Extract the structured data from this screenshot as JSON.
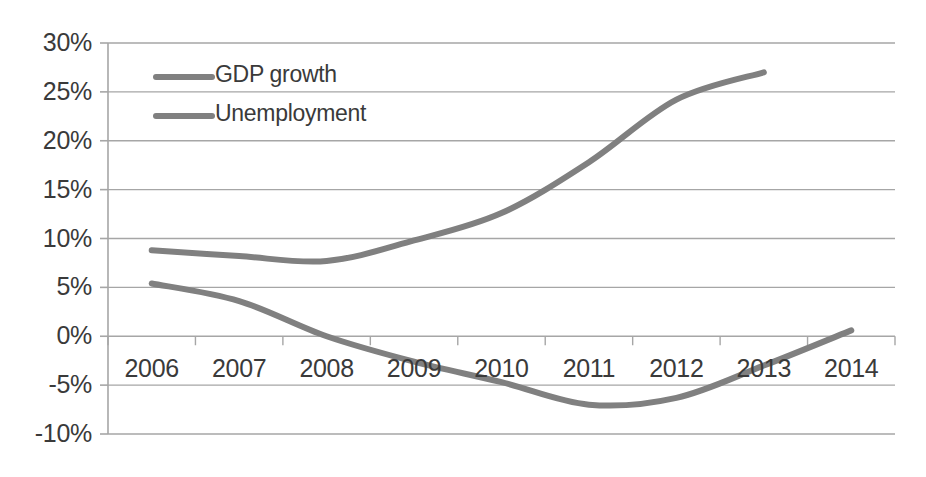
{
  "chart_data": {
    "type": "line",
    "title": "",
    "subtitle": "",
    "xlabel": "",
    "ylabel": "",
    "x": [
      "2006",
      "2007",
      "2008",
      "2009",
      "2010",
      "2011",
      "2012",
      "2013",
      "2014"
    ],
    "categories": [
      "2006",
      "2007",
      "2008",
      "2009",
      "2010",
      "2011",
      "2012",
      "2013",
      "2014"
    ],
    "series": [
      {
        "name": "Unemployment",
        "color": "#808080",
        "values": [
          8.8,
          8.2,
          7.7,
          9.8,
          12.6,
          17.8,
          24.2,
          27.0,
          null
        ]
      },
      {
        "name": "GDP growth",
        "color": "#808080",
        "values": [
          5.4,
          3.6,
          0.0,
          -2.6,
          -4.7,
          -7.0,
          -6.3,
          -3.0,
          0.6
        ]
      }
    ],
    "ylim": [
      -10,
      30
    ],
    "ytick_values": [
      30,
      25,
      20,
      15,
      10,
      5,
      0,
      -5,
      -10
    ],
    "ytick_labels": [
      "30%",
      "25%",
      "20%",
      "15%",
      "10%",
      "5%",
      "0%",
      "-5%",
      "-10%"
    ],
    "xtick_labels": [
      "2006",
      "2007",
      "2008",
      "2009",
      "2010",
      "2011",
      "2012",
      "2013",
      "2014"
    ],
    "grid": true,
    "grid_axis": "y",
    "legend": [
      "GDP growth",
      "Unemployment"
    ],
    "legend_position": "upper-left-inside",
    "line_width": 6,
    "background_color": "#ffffff",
    "axis_color": "#a6a6a6",
    "grid_color": "#a6a6a6",
    "text_color": "#3a3a3a"
  },
  "legend": {
    "items": [
      {
        "label": "GDP growth",
        "color": "#808080"
      },
      {
        "label": "Unemployment",
        "color": "#808080"
      }
    ]
  },
  "axes": {
    "y_labels": [
      "30%",
      "25%",
      "20%",
      "15%",
      "10%",
      "5%",
      "0%",
      "-5%",
      "-10%"
    ],
    "x_labels": [
      "2006",
      "2007",
      "2008",
      "2009",
      "2010",
      "2011",
      "2012",
      "2013",
      "2014"
    ]
  }
}
